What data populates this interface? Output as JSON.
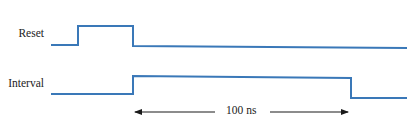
{
  "diagram": {
    "type": "timing-diagram",
    "signals": [
      {
        "name": "Reset",
        "waveform": [
          [
            51,
            45
          ],
          [
            78,
            45
          ],
          [
            78,
            26
          ],
          [
            133,
            26
          ],
          [
            133,
            46
          ],
          [
            407,
            48
          ]
        ]
      },
      {
        "name": "Interval",
        "waveform": [
          [
            51,
            94
          ],
          [
            133,
            94
          ],
          [
            133,
            76
          ],
          [
            351,
            78
          ],
          [
            351,
            98
          ],
          [
            407,
            98
          ]
        ]
      }
    ],
    "dimension": {
      "label": "100 ns",
      "from_x": 135,
      "to_x": 348,
      "y": 112
    },
    "colors": {
      "waveform": "#3a78b8",
      "arrow": "#1a1a1a",
      "text": "#222222"
    }
  }
}
